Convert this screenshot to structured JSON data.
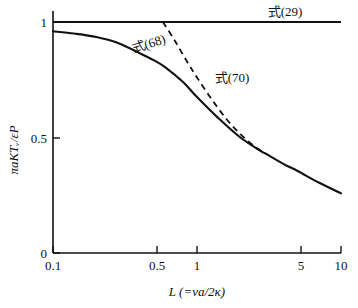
{
  "chart_data": {
    "type": "line",
    "title": "",
    "subtitle": "",
    "xlabel": "L (=va/2κ)",
    "ylabel": "πaKTᵥ/εP",
    "xscale": "log",
    "yscale": "linear",
    "xlim": [
      0.1,
      10
    ],
    "ylim": [
      0,
      1
    ],
    "grid": false,
    "legend_position": "inline-annotations",
    "xticks": [
      0.1,
      0.5,
      1,
      5,
      10
    ],
    "xtick_labels": [
      "0.1",
      "0.5",
      "1",
      "5",
      "10"
    ],
    "yticks": [
      0,
      0.5,
      1
    ],
    "ytick_labels": [
      "0",
      "0.5",
      "1"
    ],
    "annotations": [
      {
        "text": "式(29)",
        "x": 6.2,
        "y": 1.04,
        "rotation": 0
      },
      {
        "text": "式(68)",
        "x": 0.42,
        "y": 0.84,
        "rotation": -20
      },
      {
        "text": "式(70)",
        "x": 1.75,
        "y": 0.77,
        "rotation": 0
      }
    ],
    "series": [
      {
        "name": "式(29)",
        "style": "solid-horizontal",
        "x": [
          0.1,
          10
        ],
        "values": [
          1.0,
          1.0
        ]
      },
      {
        "name": "式(68)",
        "style": "solid",
        "x": [
          0.1,
          0.14,
          0.2,
          0.28,
          0.4,
          0.5,
          0.6,
          0.8,
          1.0,
          1.4,
          2.0,
          2.8,
          3.0,
          4.0,
          5.0,
          7.0,
          10.0
        ],
        "values": [
          0.96,
          0.95,
          0.935,
          0.91,
          0.865,
          0.835,
          0.805,
          0.74,
          0.675,
          0.585,
          0.5,
          0.44,
          0.43,
          0.385,
          0.355,
          0.305,
          0.258
        ]
      },
      {
        "name": "式(70)",
        "style": "dashed",
        "x": [
          0.58,
          0.7,
          0.85,
          1.0,
          1.25,
          1.6,
          2.0,
          2.5,
          3.0
        ],
        "values": [
          1.0,
          0.92,
          0.83,
          0.76,
          0.67,
          0.58,
          0.515,
          0.462,
          0.43
        ]
      }
    ]
  },
  "axes": {
    "x_title": "L (=va/2κ)",
    "y_title": "πaKTᵥ/εP",
    "x_tick_labels": [
      "0.1",
      "0.5",
      "1",
      "5",
      "10"
    ],
    "y_tick_labels": [
      "0",
      "0.5",
      "1"
    ]
  },
  "labels": {
    "eq29": "式(29)",
    "eq68": "式(68)",
    "eq70": "式(70)"
  },
  "colors": {
    "ink": "#111111",
    "background": "#ffffff"
  }
}
